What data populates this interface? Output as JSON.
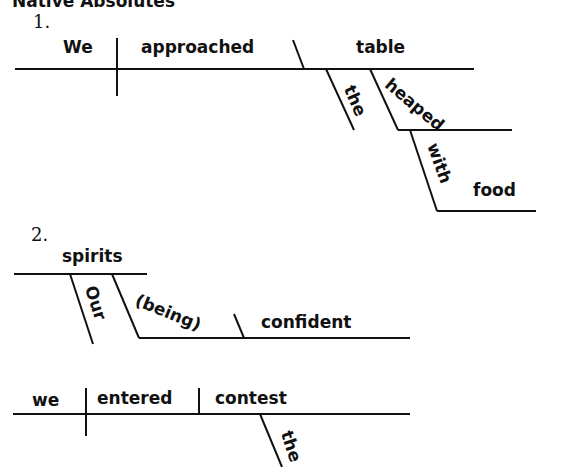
{
  "header": "Native Absolutes",
  "diagrams": [
    {
      "number": "1.",
      "words": {
        "subject": "We",
        "verb": "approached",
        "object": "table",
        "modifier_the": "the",
        "participle": "heaped",
        "preposition": "with",
        "prep_object": "food"
      }
    },
    {
      "number": "2.",
      "absolute": {
        "noun": "spirits",
        "modifier": "Our",
        "participle": "(being)",
        "complement": "confident"
      },
      "main": {
        "subject": "we",
        "verb": "entered",
        "object": "contest",
        "modifier_the": "the"
      }
    }
  ]
}
